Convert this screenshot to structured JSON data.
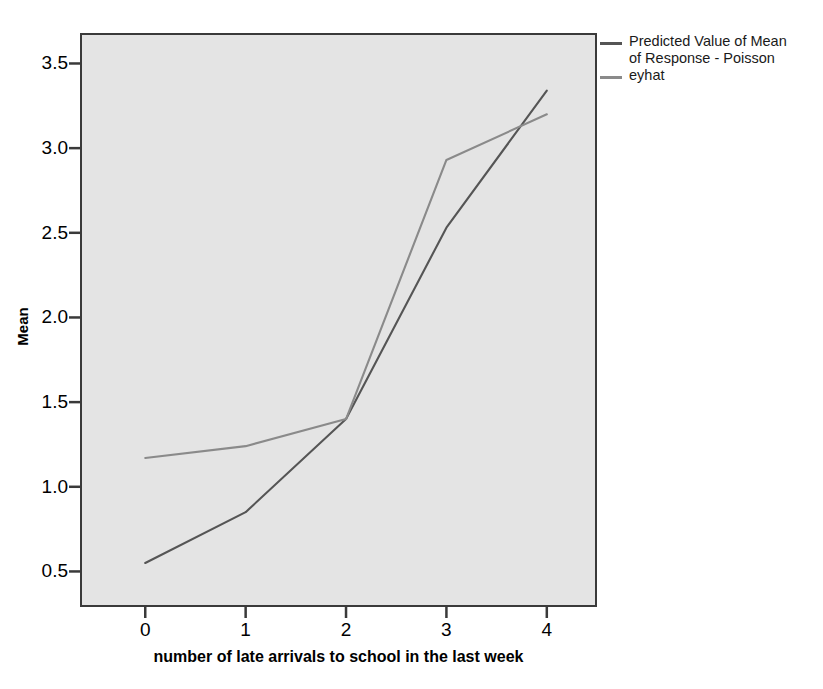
{
  "chart_data": {
    "type": "line",
    "title": "",
    "xlabel": "number of late arrivals to school in the last week",
    "ylabel": "Mean",
    "x": [
      0,
      1,
      2,
      3,
      4
    ],
    "xtick_labels": [
      "0",
      "1",
      "2",
      "3",
      "4"
    ],
    "ytick_labels": [
      "0.5",
      "1.0",
      "1.5",
      "2.0",
      "2.5",
      "3.0",
      "3.5"
    ],
    "ytick_values": [
      0.5,
      1.0,
      1.5,
      2.0,
      2.5,
      3.0,
      3.5
    ],
    "xlim": [
      -0.65,
      4.5
    ],
    "ylim": [
      0.29,
      3.68
    ],
    "grid": false,
    "legend_position": "right",
    "plot_background": "#e4e4e4",
    "series": [
      {
        "name": "Predicted Value of Mean of Response - Poisson",
        "color": "#555555",
        "values": [
          0.55,
          0.85,
          1.4,
          2.53,
          3.34
        ]
      },
      {
        "name": "eyhat",
        "color": "#8a8a8a",
        "values": [
          1.17,
          1.24,
          1.4,
          2.93,
          3.2
        ]
      }
    ]
  },
  "axes": {
    "y_title": "Mean",
    "x_title": "number of late arrivals to school in the last week"
  },
  "legend": {
    "entries": [
      {
        "label": "Predicted Value of Mean\nof Response - Poisson",
        "color": "#555555"
      },
      {
        "label": "eyhat",
        "color": "#8a8a8a"
      }
    ]
  }
}
